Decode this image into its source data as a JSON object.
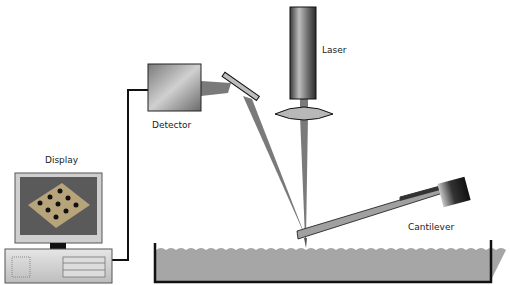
{
  "labels": {
    "laser": "Laser",
    "detector": "Detector",
    "display": "Display",
    "cantilever": "Cantilever"
  },
  "colors": {
    "beam": "#7a7a7a",
    "sample": "#a6a6a6",
    "outline": "#111111",
    "lens": "#b8b8b8",
    "screen": "#5a5a5a"
  }
}
